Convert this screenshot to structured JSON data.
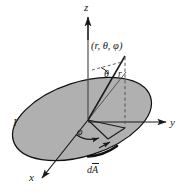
{
  "figure": {
    "background_color": "#ffffff",
    "line_color": "#1a1a1a",
    "disk_fill_color": "#b0b0b0",
    "disk_edge_color": "#111111"
  },
  "axes": {
    "z_label": "z",
    "y_label": "y",
    "x_label": "x"
  },
  "annotations": {
    "point_label": "(r, θ, φ)",
    "theta_label": "θ",
    "r_label": "r",
    "phi_label": "φ",
    "current_label": "I",
    "area_element_prefix": "d",
    "area_element_vector": "A"
  }
}
